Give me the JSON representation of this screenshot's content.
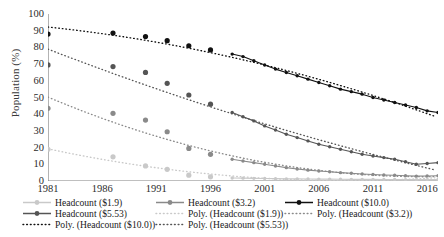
{
  "chart_data": {
    "type": "line",
    "title": "",
    "xlabel": "",
    "ylabel": "Population (%)",
    "ylim": [
      0,
      100
    ],
    "ytick_labels": [
      "100",
      "90",
      "80",
      "70",
      "60",
      "50",
      "40",
      "30",
      "20",
      "10",
      "0"
    ],
    "ytick_values": [
      100,
      90,
      80,
      70,
      60,
      50,
      40,
      30,
      20,
      10,
      0
    ],
    "xlim": [
      1981,
      2017
    ],
    "xtick_labels": [
      "1981",
      "1986",
      "1991",
      "1996",
      "2001",
      "2006",
      "2011",
      "2016"
    ],
    "xtick_values": [
      1981,
      1986,
      1991,
      1996,
      2001,
      2006,
      2011,
      2016
    ],
    "grid": false,
    "legend_position": "below",
    "series": [
      {
        "name": "Headcount ($10.0)",
        "color": "#111111",
        "style": "line-markers",
        "x": [
          1981,
          1987,
          1990,
          1992,
          1994,
          1996,
          1998,
          1999,
          2000,
          2001,
          2002,
          2003,
          2004,
          2005,
          2006,
          2007,
          2008,
          2009,
          2010,
          2011,
          2012,
          2013,
          2014,
          2015,
          2016,
          2017
        ],
        "values": [
          88.0,
          88.6,
          86.5,
          84.0,
          81.0,
          78.5,
          76.0,
          74.5,
          72.0,
          69.5,
          67.0,
          65.0,
          63.0,
          61.0,
          59.0,
          57.0,
          55.0,
          53.5,
          52.0,
          50.0,
          48.5,
          47.0,
          45.5,
          44.0,
          42.0,
          41.0
        ]
      },
      {
        "name": "Headcount ($5.53)",
        "color": "#555555",
        "style": "line-markers",
        "x": [
          1981,
          1987,
          1990,
          1992,
          1994,
          1996,
          1998,
          1999,
          2000,
          2001,
          2002,
          2003,
          2004,
          2005,
          2006,
          2007,
          2008,
          2009,
          2010,
          2011,
          2012,
          2013,
          2014,
          2015,
          2016,
          2017
        ],
        "values": [
          69.5,
          68.5,
          65.0,
          58.5,
          51.5,
          46.0,
          41.0,
          38.5,
          36.0,
          33.0,
          30.5,
          28.0,
          26.0,
          24.0,
          22.0,
          20.5,
          19.0,
          17.5,
          16.0,
          15.0,
          14.0,
          13.0,
          11.5,
          10.0,
          10.5,
          11.0
        ]
      },
      {
        "name": "Headcount ($3.2)",
        "color": "#8a8a8a",
        "style": "line-markers",
        "x": [
          1981,
          1987,
          1990,
          1992,
          1994,
          1996,
          1998,
          1999,
          2000,
          2001,
          2002,
          2003,
          2004,
          2005,
          2006,
          2007,
          2008,
          2009,
          2010,
          2011,
          2012,
          2013,
          2014,
          2015,
          2016,
          2017
        ],
        "values": [
          43.5,
          40.5,
          36.5,
          29.5,
          19.5,
          16.0,
          13.0,
          12.0,
          11.0,
          10.0,
          9.0,
          8.0,
          7.2,
          6.5,
          6.0,
          5.5,
          5.0,
          4.6,
          4.2,
          3.9,
          3.6,
          3.4,
          3.1,
          2.9,
          3.0,
          3.1
        ]
      },
      {
        "name": "Headcount ($1.9)",
        "color": "#c9c9c9",
        "style": "line-markers",
        "x": [
          1981,
          1987,
          1990,
          1992,
          1994,
          1996,
          1998,
          1999,
          2000,
          2001,
          2002,
          2003,
          2004,
          2005,
          2006,
          2007,
          2008,
          2009,
          2010,
          2011,
          2012,
          2013,
          2014,
          2015,
          2016,
          2017
        ],
        "values": [
          19.0,
          14.5,
          9.0,
          7.0,
          3.5,
          2.5,
          1.8,
          1.7,
          1.6,
          1.5,
          1.4,
          1.3,
          1.25,
          1.2,
          1.15,
          1.1,
          1.05,
          1.0,
          1.0,
          0.95,
          0.9,
          0.9,
          0.85,
          0.8,
          0.85,
          0.9
        ]
      }
    ],
    "trendlines": [
      {
        "name": "Poly. (Headcount ($10.0))",
        "color": "#111111",
        "style": "dotted",
        "of": "Headcount ($10.0)"
      },
      {
        "name": "Poly. (Headcount ($5.53))",
        "color": "#555555",
        "style": "dotted",
        "of": "Headcount ($5.53)"
      },
      {
        "name": "Poly. (Headcount ($3.2))",
        "color": "#8a8a8a",
        "style": "dotted",
        "of": "Headcount ($3.2)"
      },
      {
        "name": "Poly. (Headcount ($1.9))",
        "color": "#c9c9c9",
        "style": "dotted",
        "of": "Headcount ($1.9)"
      }
    ]
  },
  "legend": {
    "items": [
      {
        "label": "Headcount ($1.9)",
        "color": "#c9c9c9",
        "style": "line-markers",
        "col": 0,
        "row": 0
      },
      {
        "label": "Headcount ($3.2)",
        "color": "#8a8a8a",
        "style": "line-markers",
        "col": 1,
        "row": 0
      },
      {
        "label": "Headcount ($10.0)",
        "color": "#111111",
        "style": "line-markers",
        "col": 2,
        "row": 0
      },
      {
        "label": "Headcount ($5.53)",
        "color": "#555555",
        "style": "line-markers",
        "col": 0,
        "row": 1
      },
      {
        "label": "Poly. (Headcount ($1.9))",
        "color": "#c9c9c9",
        "style": "dotted",
        "col": 1,
        "row": 1
      },
      {
        "label": "Poly. (Headcount ($3.2))",
        "color": "#8a8a8a",
        "style": "dotted",
        "col": 2,
        "row": 1
      },
      {
        "label": "Poly. (Headcount ($10.0))",
        "color": "#111111",
        "style": "dotted",
        "col": 0,
        "row": 2
      },
      {
        "label": "Poly. (Headcount ($5.53))",
        "color": "#555555",
        "style": "dotted",
        "col": 1,
        "row": 2
      }
    ]
  },
  "axis": {
    "line_color": "#808080"
  }
}
